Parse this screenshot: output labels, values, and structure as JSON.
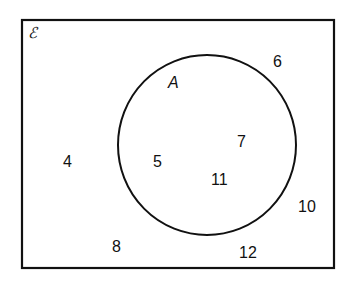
{
  "diagram": {
    "type": "venn",
    "universal_set_symbol": "ℰ",
    "sets": [
      {
        "name": "A",
        "label": "A",
        "elements": [
          "5",
          "7",
          "11"
        ]
      }
    ],
    "outside_elements": [
      "4",
      "6",
      "8",
      "10",
      "12"
    ],
    "labels": {
      "universal": "ℰ",
      "set_a": "A",
      "n4": "4",
      "n5": "5",
      "n6": "6",
      "n7": "7",
      "n8": "8",
      "n10": "10",
      "n11": "11",
      "n12": "12"
    },
    "colors": {
      "stroke": "#111111",
      "background": "#ffffff"
    }
  }
}
